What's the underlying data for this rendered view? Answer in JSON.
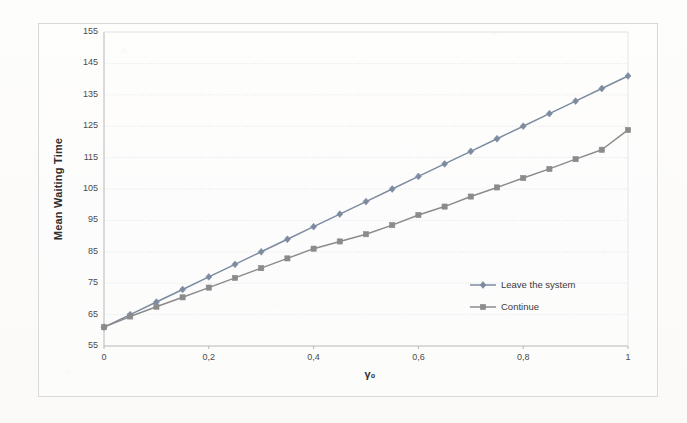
{
  "chart_data": {
    "type": "line",
    "title": "",
    "xlabel": "γ₀",
    "ylabel": "Mean Waiting Time",
    "xlim": [
      0,
      1
    ],
    "ylim": [
      55,
      155
    ],
    "xticks": [
      "0",
      "0,2",
      "0,4",
      "0,6",
      "0,8",
      "1"
    ],
    "xtick_values": [
      0,
      0.2,
      0.4,
      0.6,
      0.8,
      1
    ],
    "yticks": [
      "55",
      "65",
      "75",
      "85",
      "95",
      "105",
      "115",
      "125",
      "135",
      "145",
      "155"
    ],
    "ytick_values": [
      55,
      65,
      75,
      85,
      95,
      105,
      115,
      125,
      135,
      145,
      155
    ],
    "grid": "horizontal",
    "legend_position": "inside-right",
    "x": [
      0,
      0.05,
      0.1,
      0.15,
      0.2,
      0.25,
      0.3,
      0.35,
      0.4,
      0.45,
      0.5,
      0.55,
      0.6,
      0.65,
      0.7,
      0.75,
      0.8,
      0.85,
      0.9,
      0.95,
      1
    ],
    "series": [
      {
        "name": "Leave the system",
        "marker": "diamond",
        "color": "#7d8ba0",
        "values": [
          61.0,
          65.0,
          69.0,
          73.0,
          77.0,
          81.0,
          85.0,
          89.0,
          93.0,
          97.0,
          101.0,
          105.0,
          109.0,
          113.0,
          117.0,
          121.0,
          125.0,
          129.0,
          133.0,
          137.0,
          141.0
        ]
      },
      {
        "name": "Continue",
        "marker": "square",
        "color": "#8b8b8b",
        "values": [
          61.0,
          64.4,
          67.5,
          70.5,
          73.6,
          76.7,
          79.8,
          82.9,
          86.0,
          88.3,
          90.6,
          93.5,
          96.7,
          99.4,
          102.6,
          105.5,
          108.5,
          111.4,
          114.5,
          117.5,
          123.8
        ]
      }
    ]
  },
  "legend": {
    "items": [
      {
        "label": "Leave the system"
      },
      {
        "label": "Continue"
      }
    ]
  },
  "colors": {
    "series_leave": "#7d8ba0",
    "series_continue": "#8b8b8b",
    "grid": "#d7dce3",
    "axis": "#b8b8b8",
    "text": "#3a3a3a"
  }
}
